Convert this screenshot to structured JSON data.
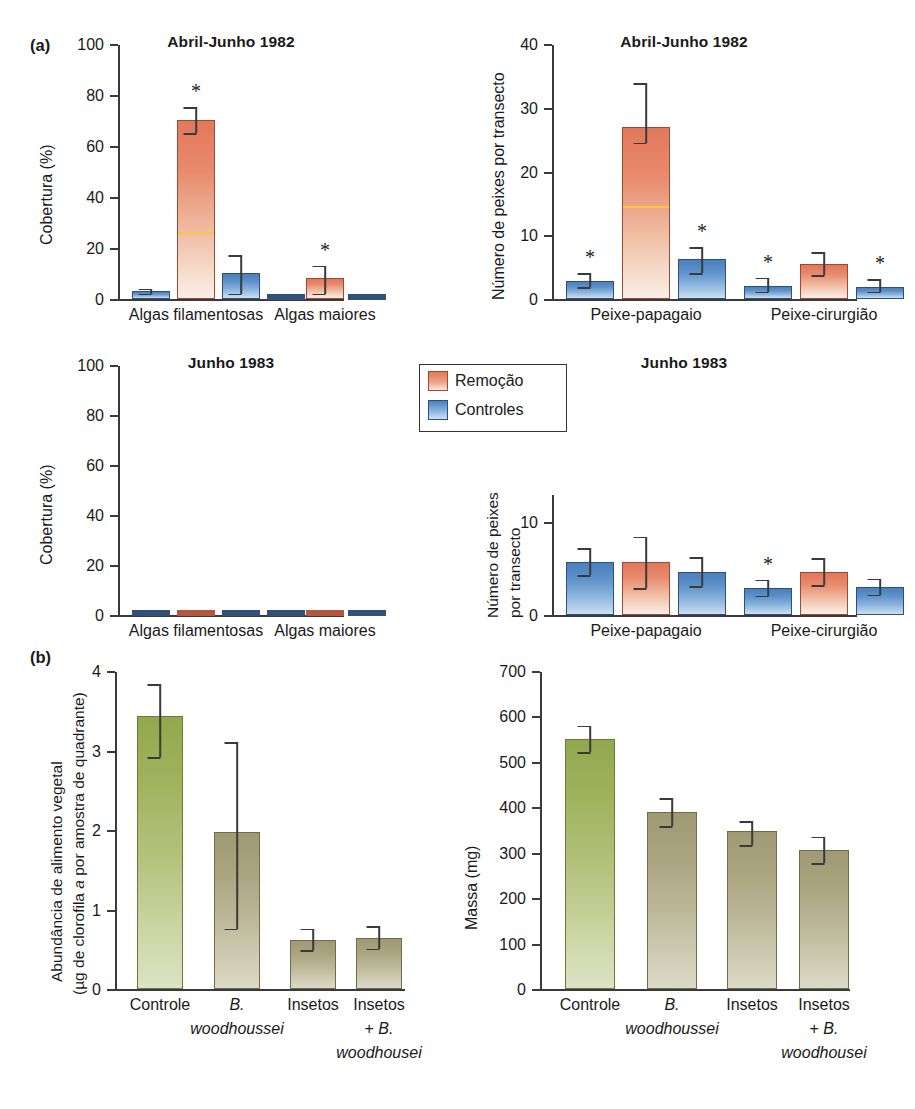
{
  "figure": {
    "panel_a_letter": "(a)",
    "panel_b_letter": "(b)"
  },
  "legend": {
    "position": "center-upper-middle",
    "items": [
      {
        "label": "Remoção",
        "color": "#e2785c",
        "key": "removal"
      },
      {
        "label": "Controles",
        "color": "#4a80bd",
        "key": "controls"
      }
    ]
  },
  "chart_data": [
    {
      "id": "cover-1982",
      "type": "bar",
      "title": "Abril-Junho 1982",
      "xlabel": "",
      "ylabel": "Cobertura (%)",
      "ylim": [
        0,
        100
      ],
      "yticks": [
        0,
        20,
        40,
        60,
        80,
        100
      ],
      "yticklabels": [
        "0",
        "20",
        "40",
        "60",
        "80",
        "100"
      ],
      "categories": [
        "Algas filamentosas",
        "Algas maiores"
      ],
      "grid": false,
      "bars": [
        {
          "group": "Algas filamentosas",
          "series": "Controles",
          "value": 3.5,
          "err_low": 1.0,
          "err_high": 1.0,
          "significant": false
        },
        {
          "group": "Algas filamentosas",
          "series": "Remoção",
          "value": 70.5,
          "err_low": 5.0,
          "err_high": 5.0,
          "significant": true,
          "inner_line_at": 26.5
        },
        {
          "group": "Algas filamentosas",
          "series": "Controles",
          "value": 10.5,
          "err_low": 8.0,
          "err_high": 7.0,
          "significant": false
        },
        {
          "group": "Algas maiores",
          "series": "Controles",
          "value": 0.6,
          "err_low": 0.0,
          "err_high": 0.0,
          "significant": false
        },
        {
          "group": "Algas maiores",
          "series": "Remoção",
          "value": 8.5,
          "err_low": 6.0,
          "err_high": 5.0,
          "significant": true
        },
        {
          "group": "Algas maiores",
          "series": "Controles",
          "value": 0.6,
          "err_low": 0.0,
          "err_high": 0.0,
          "significant": false
        }
      ]
    },
    {
      "id": "fish-1982",
      "type": "bar",
      "title": "Abril-Junho 1982",
      "xlabel": "",
      "ylabel": "Número de peixes por transecto",
      "ylim": [
        0,
        40
      ],
      "yticks": [
        0,
        10,
        20,
        30,
        40
      ],
      "yticklabels": [
        "0",
        "10",
        "20",
        "30",
        "40"
      ],
      "categories": [
        "Peixe-papagaio",
        "Peixe-cirurgião"
      ],
      "grid": false,
      "bars": [
        {
          "group": "Peixe-papagaio",
          "series": "Controles",
          "value": 3.0,
          "err_low": 1.0,
          "err_high": 1.2,
          "significant": true
        },
        {
          "group": "Peixe-papagaio",
          "series": "Remoção",
          "value": 27.2,
          "err_low": 2.5,
          "err_high": 6.8,
          "significant": false,
          "inner_line_at": 14.8
        },
        {
          "group": "Peixe-papagaio",
          "series": "Controles",
          "value": 6.5,
          "err_low": 2.3,
          "err_high": 1.8,
          "significant": true
        },
        {
          "group": "Peixe-cirurgião",
          "series": "Controles",
          "value": 2.2,
          "err_low": 0.9,
          "err_high": 1.3,
          "significant": true
        },
        {
          "group": "Peixe-cirurgião",
          "series": "Remoção",
          "value": 5.7,
          "err_low": 1.8,
          "err_high": 1.8,
          "significant": false
        },
        {
          "group": "Peixe-cirurgião",
          "series": "Controles",
          "value": 2.1,
          "err_low": 0.8,
          "err_high": 1.2,
          "significant": true
        }
      ]
    },
    {
      "id": "cover-1983",
      "type": "bar",
      "title": "Junho 1983",
      "xlabel": "",
      "ylabel": "Cobertura (%)",
      "ylim": [
        0,
        100
      ],
      "yticks": [
        0,
        20,
        40,
        60,
        80,
        100
      ],
      "yticklabels": [
        "0",
        "20",
        "40",
        "60",
        "80",
        "100"
      ],
      "categories": [
        "Algas filamentosas",
        "Algas maiores"
      ],
      "grid": false,
      "bars": [
        {
          "group": "Algas filamentosas",
          "series": "Controles",
          "value": 0.4,
          "err_low": 0,
          "err_high": 0,
          "significant": false
        },
        {
          "group": "Algas filamentosas",
          "series": "Remoção",
          "value": 0.4,
          "err_low": 0,
          "err_high": 0,
          "significant": false
        },
        {
          "group": "Algas filamentosas",
          "series": "Controles",
          "value": 0.4,
          "err_low": 0,
          "err_high": 0,
          "significant": false
        },
        {
          "group": "Algas maiores",
          "series": "Controles",
          "value": 0.4,
          "err_low": 0,
          "err_high": 0,
          "significant": false
        },
        {
          "group": "Algas maiores",
          "series": "Remoção",
          "value": 0.4,
          "err_low": 0,
          "err_high": 0,
          "significant": false
        },
        {
          "group": "Algas maiores",
          "series": "Controles",
          "value": 0.4,
          "err_low": 0,
          "err_high": 0,
          "significant": false
        }
      ]
    },
    {
      "id": "fish-1983",
      "type": "bar",
      "title": "Junho 1983",
      "xlabel": "",
      "ylabel": "Número de peixes por transecto",
      "ylim": [
        0,
        13
      ],
      "yticks": [
        0,
        10
      ],
      "yticklabels": [
        "0",
        "10"
      ],
      "categories": [
        "Peixe-papagaio",
        "Peixe-cirurgião"
      ],
      "grid": false,
      "bars": [
        {
          "group": "Peixe-papagaio",
          "series": "Controles",
          "value": 5.8,
          "err_low": 1.4,
          "err_high": 1.5,
          "significant": false
        },
        {
          "group": "Peixe-papagaio",
          "series": "Remoção",
          "value": 5.8,
          "err_low": 2.8,
          "err_high": 2.7,
          "significant": false
        },
        {
          "group": "Peixe-papagaio",
          "series": "Controles",
          "value": 4.7,
          "err_low": 1.5,
          "err_high": 1.6,
          "significant": false
        },
        {
          "group": "Peixe-cirurgião",
          "series": "Controles",
          "value": 3.0,
          "err_low": 0.8,
          "err_high": 0.9,
          "significant": true
        },
        {
          "group": "Peixe-cirurgião",
          "series": "Remoção",
          "value": 4.7,
          "err_low": 1.4,
          "err_high": 1.5,
          "significant": false
        },
        {
          "group": "Peixe-cirurgião",
          "series": "Controles",
          "value": 3.1,
          "err_low": 0.8,
          "err_high": 0.9,
          "significant": false
        }
      ]
    },
    {
      "id": "plant-food-abundance",
      "type": "bar",
      "title": "",
      "ylabel_line1": "Abundância de alimento vegetal",
      "ylabel_line2": "(µg de clorofila a por amostra de quadrante)",
      "xlabel": "",
      "ylim": [
        0,
        4
      ],
      "yticks": [
        0,
        1,
        2,
        3,
        4
      ],
      "yticklabels": [
        "0",
        "1",
        "2",
        "3",
        "4"
      ],
      "categories": [
        "Controle",
        "B. woodhoussei",
        "Insetos",
        "Insetos + B. woodhousei"
      ],
      "category_lines": [
        [
          "Controle"
        ],
        [
          "B.",
          "woodhoussei"
        ],
        [
          "Insetos"
        ],
        [
          "Insetos",
          "+ B.",
          "woodhousei"
        ]
      ],
      "grid": false,
      "values": [
        3.45,
        1.99,
        0.63,
        0.66
      ],
      "err_low": [
        0.52,
        1.22,
        0.13,
        0.14
      ],
      "err_high": [
        0.4,
        1.13,
        0.14,
        0.14
      ],
      "colors": [
        "green",
        "tan",
        "tan",
        "tan"
      ]
    },
    {
      "id": "mass",
      "type": "bar",
      "title": "",
      "ylabel": "Massa (mg)",
      "xlabel": "",
      "ylim": [
        0,
        700
      ],
      "yticks": [
        0,
        100,
        200,
        300,
        400,
        500,
        600,
        700
      ],
      "yticklabels": [
        "0",
        "100",
        "200",
        "300",
        "400",
        "500",
        "600",
        "700"
      ],
      "categories": [
        "Controle",
        "B. woodhoussei",
        "Insetos",
        "Insetos + B. woodhousei"
      ],
      "category_lines": [
        [
          "Controle"
        ],
        [
          "B.",
          "woodhoussei"
        ],
        [
          "Insetos"
        ],
        [
          "Insetos",
          "+ B.",
          "woodhousei"
        ]
      ],
      "grid": false,
      "values": [
        553,
        392,
        349,
        308
      ],
      "err_low": [
        30,
        31,
        30,
        29
      ],
      "err_high": [
        29,
        30,
        22,
        29
      ],
      "colors": [
        "green",
        "tan",
        "tan",
        "tan"
      ]
    }
  ]
}
